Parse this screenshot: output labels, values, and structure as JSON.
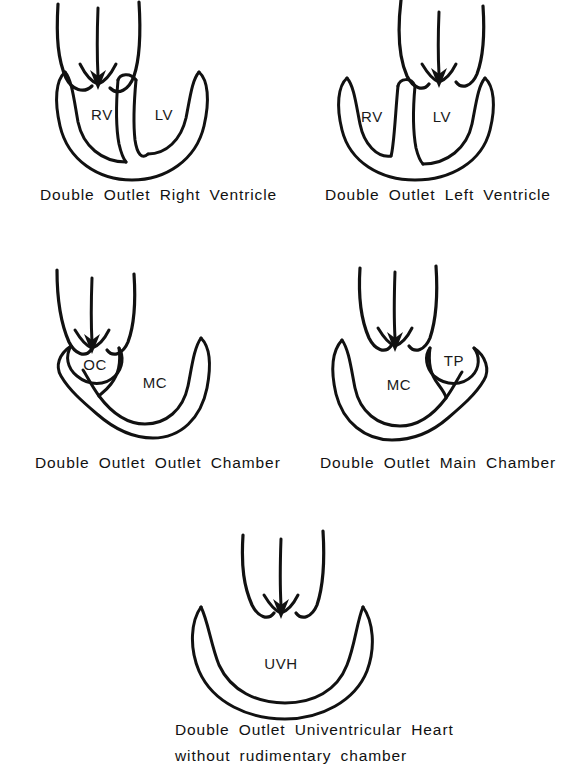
{
  "figure": {
    "title": "",
    "stroke_color": "#111111",
    "background_color": "#ffffff",
    "panel_count": 5
  },
  "panels": [
    {
      "id": "double-outlet-right-ventricle",
      "caption": "Double  Outlet  Right  Ventricle",
      "chamber_labels": [
        "RV",
        "LV"
      ],
      "description": "Both great arteries arise above the right ventricle"
    },
    {
      "id": "double-outlet-left-ventricle",
      "caption": "Double  Outlet  Left  Ventricle",
      "chamber_labels": [
        "RV",
        "LV"
      ],
      "description": "Both great arteries arise above the left ventricle"
    },
    {
      "id": "double-outlet-outlet-chamber",
      "caption": "Double  Outlet  Outlet  Chamber",
      "chamber_labels": [
        "OC",
        "MC"
      ],
      "description": "Both great arteries arise from the outlet chamber"
    },
    {
      "id": "double-outlet-main-chamber",
      "caption": "Double  Outlet  Main  Chamber",
      "chamber_labels": [
        "MC",
        "TP"
      ],
      "description": "Both great arteries arise from the main chamber"
    },
    {
      "id": "double-outlet-univentricular-heart",
      "caption_line1": "Double  Outlet  Univentricular  Heart",
      "caption_line2": "without   rudimentary   chamber",
      "chamber_labels": [
        "UVH"
      ],
      "description": "Both great arteries arise from a single ventricular chamber"
    }
  ]
}
